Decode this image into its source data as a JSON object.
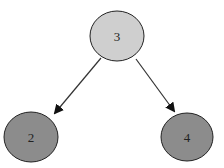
{
  "diagram": {
    "type": "binary-tree",
    "nodes": [
      {
        "id": "n3",
        "label": "3",
        "cx": 117,
        "cy": 36,
        "rx": 27,
        "ry": 25,
        "fill": "#cfcfcf"
      },
      {
        "id": "n2",
        "label": "2",
        "cx": 31,
        "cy": 137,
        "rx": 27,
        "ry": 25,
        "fill": "#8c8c8c"
      },
      {
        "id": "n4",
        "label": "4",
        "cx": 187,
        "cy": 137,
        "rx": 26,
        "ry": 24,
        "fill": "#8c8c8c"
      }
    ],
    "edges": [
      {
        "from": "3",
        "to": "2"
      },
      {
        "from": "3",
        "to": "4"
      }
    ],
    "colors": {
      "root_fill": "#cfcfcf",
      "leaf_fill": "#8c8c8c",
      "stroke": "#222222"
    }
  }
}
